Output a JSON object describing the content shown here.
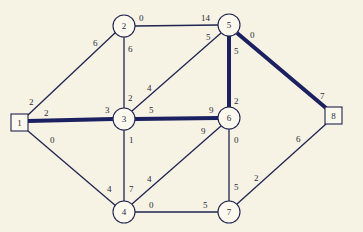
{
  "colors": {
    "background": "#f6f2e4",
    "edge": "#1f2450",
    "highlight": "#1b2060",
    "node_fill": "#fbf8ee",
    "text": "#2a2c3a"
  },
  "nodes": [
    {
      "id": "1",
      "label": "1",
      "shape": "square",
      "x": 20,
      "y": 123
    },
    {
      "id": "2",
      "label": "2",
      "shape": "circle",
      "x": 124,
      "y": 26
    },
    {
      "id": "3",
      "label": "3",
      "shape": "circle",
      "x": 124,
      "y": 119
    },
    {
      "id": "4",
      "label": "4",
      "shape": "circle",
      "x": 124,
      "y": 212
    },
    {
      "id": "5",
      "label": "5",
      "shape": "circle",
      "x": 229,
      "y": 25
    },
    {
      "id": "6",
      "label": "6",
      "shape": "circle",
      "x": 229,
      "y": 118
    },
    {
      "id": "7",
      "label": "7",
      "shape": "circle",
      "x": 229,
      "y": 212
    },
    {
      "id": "8",
      "label": "8",
      "shape": "square",
      "x": 333,
      "y": 116
    }
  ],
  "edges": [
    {
      "from": "1",
      "to": "2",
      "from_label": "2",
      "to_label": "6",
      "highlight": false
    },
    {
      "from": "1",
      "to": "3",
      "from_label": "2",
      "to_label": "3",
      "highlight": true
    },
    {
      "from": "1",
      "to": "4",
      "from_label": "0",
      "to_label": "4",
      "highlight": false
    },
    {
      "from": "2",
      "to": "5",
      "from_label": "0",
      "to_label": "14",
      "highlight": false
    },
    {
      "from": "2",
      "to": "3",
      "from_label": "6",
      "to_label": "2",
      "highlight": false
    },
    {
      "from": "3",
      "to": "5",
      "from_label": "4",
      "to_label": "5",
      "highlight": false
    },
    {
      "from": "3",
      "to": "6",
      "from_label": "5",
      "to_label": "9",
      "highlight": true
    },
    {
      "from": "3",
      "to": "4",
      "from_label": "1",
      "to_label": "7",
      "highlight": false
    },
    {
      "from": "5",
      "to": "6",
      "from_label": "5",
      "to_label": "2",
      "highlight": true
    },
    {
      "from": "5",
      "to": "8",
      "from_label": "0",
      "to_label": "7",
      "highlight": true
    },
    {
      "from": "4",
      "to": "6",
      "from_label": "4",
      "to_label": "9",
      "highlight": false
    },
    {
      "from": "6",
      "to": "7",
      "from_label": "0",
      "to_label": "5",
      "highlight": false
    },
    {
      "from": "4",
      "to": "7",
      "from_label": "0",
      "to_label": "5",
      "highlight": false
    },
    {
      "from": "7",
      "to": "8",
      "from_label": "2",
      "to_label": "6",
      "highlight": false
    }
  ]
}
